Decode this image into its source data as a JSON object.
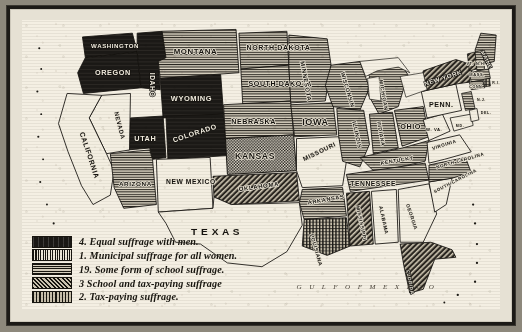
{
  "map": {
    "title": "",
    "legend": {
      "items": [
        {
          "key": "equal",
          "number": "4.",
          "label": "Equal suffrage with men.",
          "swatch": "sw-equal"
        },
        {
          "key": "municipal",
          "number": "1.",
          "label": "Municipal suffrage for all women.",
          "swatch": "sw-municipal"
        },
        {
          "key": "school",
          "number": "19.",
          "label": "Some form of school suffrage.",
          "swatch": "sw-school"
        },
        {
          "key": "schooltax",
          "number": "3",
          "label": "School and tax-paying suffrage",
          "swatch": "sw-schooltax"
        },
        {
          "key": "tax",
          "number": "2.",
          "label": "Tax-paying suffrage.",
          "swatch": "sw-tax"
        }
      ]
    },
    "ocean_labels": [
      {
        "name": "gulf-of-mexico-label",
        "text": "G U L F   O F   M E X I C O"
      }
    ],
    "states": [
      {
        "name": "washington",
        "label": "WASHINGTON",
        "category": "equal"
      },
      {
        "name": "oregon",
        "label": "OREGON",
        "category": "equal"
      },
      {
        "name": "idaho",
        "label": "IDAHO",
        "category": "equal"
      },
      {
        "name": "montana",
        "label": "MONTANA",
        "category": "school"
      },
      {
        "name": "wyoming",
        "label": "WYOMING",
        "category": "equal"
      },
      {
        "name": "utah",
        "label": "UTAH",
        "category": "equal"
      },
      {
        "name": "colorado",
        "label": "COLORADO",
        "category": "equal"
      },
      {
        "name": "california",
        "label": "CALIFORNIA",
        "category": "none"
      },
      {
        "name": "nevada",
        "label": "NEVADA",
        "category": "none"
      },
      {
        "name": "arizona",
        "label": "ARIZONA",
        "category": "school"
      },
      {
        "name": "new-mexico",
        "label": "NEW MEXICO",
        "category": "none"
      },
      {
        "name": "north-dakota",
        "label": "NORTH DAKOTA",
        "category": "school"
      },
      {
        "name": "south-dakota",
        "label": "SOUTH DAKOTA",
        "category": "school"
      },
      {
        "name": "nebraska",
        "label": "NEBRASKA",
        "category": "school"
      },
      {
        "name": "kansas",
        "label": "KANSAS",
        "category": "municipal"
      },
      {
        "name": "oklahoma",
        "label": "OKLAHOMA",
        "category": "schooltax"
      },
      {
        "name": "texas",
        "label": "T E X A S",
        "category": "none"
      },
      {
        "name": "minnesota",
        "label": "MINNESOTA",
        "category": "school"
      },
      {
        "name": "iowa",
        "label": "IOWA",
        "category": "school"
      },
      {
        "name": "missouri",
        "label": "MISSOURI",
        "category": "none"
      },
      {
        "name": "arkansas",
        "label": "ARKANSAS",
        "category": "school"
      },
      {
        "name": "louisiana",
        "label": "LOUISIANA",
        "category": "tax"
      },
      {
        "name": "wisconsin",
        "label": "WISCONSIN",
        "category": "school"
      },
      {
        "name": "illinois",
        "label": "ILLINOIS",
        "category": "school"
      },
      {
        "name": "michigan",
        "label": "MICHIGAN",
        "category": "school"
      },
      {
        "name": "indiana",
        "label": "INDIANA",
        "category": "school"
      },
      {
        "name": "ohio",
        "label": "OHIO",
        "category": "school"
      },
      {
        "name": "kentucky",
        "label": "KENTUCKY",
        "category": "school"
      },
      {
        "name": "tennessee",
        "label": "TENNESSEE",
        "category": "school"
      },
      {
        "name": "mississippi",
        "label": "MISSISSIPPI",
        "category": "schooltax"
      },
      {
        "name": "alabama",
        "label": "ALABAMA",
        "category": "none"
      },
      {
        "name": "georgia",
        "label": "GEORGIA",
        "category": "none"
      },
      {
        "name": "florida",
        "label": "FLORIDA",
        "category": "schooltax"
      },
      {
        "name": "south-carolina",
        "label": "SOUTH CAROLINA",
        "category": "none"
      },
      {
        "name": "north-carolina",
        "label": "NORTH CAROLINA",
        "category": "school"
      },
      {
        "name": "virginia",
        "label": "VIRGINIA",
        "category": "none"
      },
      {
        "name": "west-virginia",
        "label": "W. VA.",
        "category": "none"
      },
      {
        "name": "pennsylvania",
        "label": "PENN.",
        "category": "none"
      },
      {
        "name": "new-york",
        "label": "NEW YORK",
        "category": "school"
      },
      {
        "name": "maine",
        "label": "MAINE",
        "category": "school"
      },
      {
        "name": "vermont",
        "label": "VT.",
        "category": "schooltax"
      },
      {
        "name": "new-hampshire",
        "label": "N.H.",
        "category": "school"
      },
      {
        "name": "massachusetts",
        "label": "MASS.",
        "category": "school"
      },
      {
        "name": "connecticut",
        "label": "CONN.",
        "category": "school"
      },
      {
        "name": "rhode-island",
        "label": "R.I.",
        "category": "tax"
      },
      {
        "name": "new-jersey",
        "label": "N.J.",
        "category": "school"
      },
      {
        "name": "delaware",
        "label": "DEL.",
        "category": "none"
      },
      {
        "name": "maryland",
        "label": "MD.",
        "category": "none"
      }
    ]
  }
}
